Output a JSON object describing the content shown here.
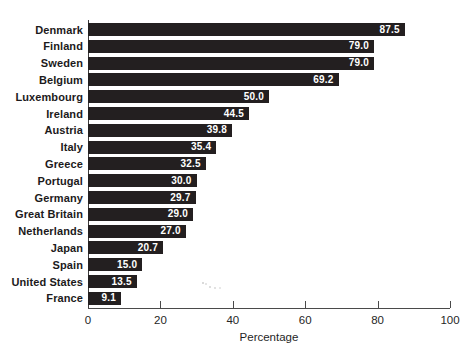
{
  "chart_data": {
    "type": "bar",
    "orientation": "horizontal",
    "title": "",
    "categories": [
      "Denmark",
      "Finland",
      "Sweden",
      "Belgium",
      "Luxembourg",
      "Ireland",
      "Austria",
      "Italy",
      "Greece",
      "Portugal",
      "Germany",
      "Great Britain",
      "Netherlands",
      "Japan",
      "Spain",
      "United States",
      "France"
    ],
    "values": [
      87.5,
      79.0,
      79.0,
      69.2,
      50.0,
      44.5,
      39.8,
      35.4,
      32.5,
      30.0,
      29.7,
      29.0,
      27.0,
      20.7,
      15.0,
      13.5,
      9.1
    ],
    "value_labels": [
      "87.5",
      "79.0",
      "79.0",
      "69.2",
      "50.0",
      "44.5",
      "39.8",
      "35.4",
      "32.5",
      "30.0",
      "29.7",
      "29.0",
      "27.0",
      "20.7",
      "15.0",
      "13.5",
      "9.1"
    ],
    "xlabel": "Percentage",
    "x_ticks": [
      0,
      20,
      40,
      60,
      80,
      100
    ],
    "x_tick_labels": [
      "0",
      "20",
      "40",
      "60",
      "80",
      "100"
    ],
    "xlim": [
      0,
      100
    ],
    "grid": false,
    "legend": false,
    "bar_color": "#231f20",
    "value_label_color": "#ffffff",
    "axis_color": "#4a4a4a",
    "label_color": "#1c1a1b"
  }
}
